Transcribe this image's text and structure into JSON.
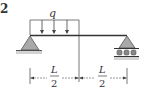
{
  "problem": {
    "number": "2"
  },
  "load": {
    "symbol": "q",
    "type": "uniformly distributed load",
    "extent": "left half of beam"
  },
  "dimensions": {
    "left_span": {
      "numerator": "L",
      "denominator": "2"
    },
    "right_span": {
      "numerator": "L",
      "denominator": "2"
    }
  },
  "supports": {
    "left": "pin",
    "right": "roller"
  },
  "colors": {
    "line": "#333333",
    "support_fill": "#a9a9a9",
    "ground": "#c8c8c8"
  }
}
